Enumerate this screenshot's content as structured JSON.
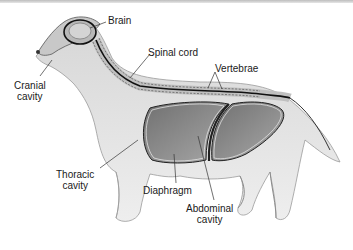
{
  "diagram": {
    "labels": {
      "brain": "Brain",
      "spinal_cord": "Spinal cord",
      "vertebrae": "Vertebrae",
      "cranial_line1": "Cranial",
      "cranial_line2": "cavity",
      "thoracic_line1": "Thoracic",
      "thoracic_line2": "cavity",
      "diaphragm": "Diaphragm",
      "abdominal_line1": "Abdominal",
      "abdominal_line2": "cavity"
    },
    "colors": {
      "fur": "#e2e2e2",
      "fur_shadow": "#bdbdbd",
      "cavity_fill": "#8a8a8a",
      "cavity_light": "#b0b0b0",
      "outline": "#2a2a2a",
      "leader_line": "#333333"
    }
  }
}
